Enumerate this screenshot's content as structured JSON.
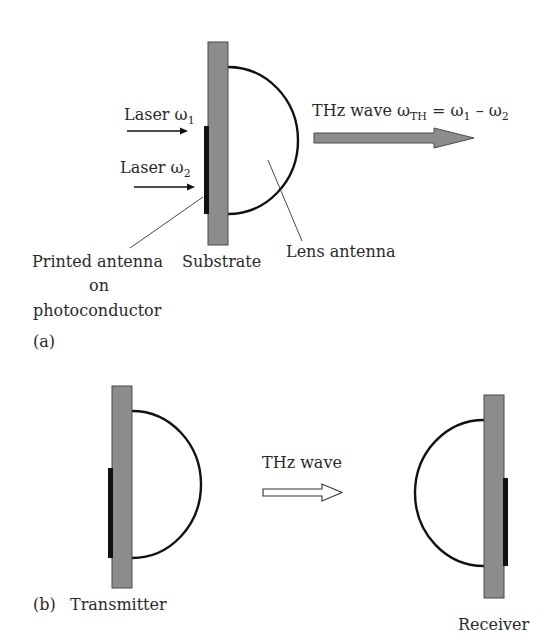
{
  "panel_a": {
    "tag": "(a)",
    "laser1": {
      "label": "Laser ω",
      "sub": "1"
    },
    "laser2": {
      "label": "Laser ω",
      "sub": "2"
    },
    "thz_label": {
      "prefix": "THz wave ω",
      "sub_th": "TH",
      "eq": " = ω",
      "sub1": "1",
      "minus": " – ω",
      "sub2": "2"
    },
    "printed_antenna_label": [
      "Printed antenna",
      "on",
      "photoconductor"
    ],
    "substrate_label": "Substrate",
    "lens_label": "Lens antenna"
  },
  "panel_b": {
    "tag": "(b)",
    "transmitter_label": "Transmitter",
    "receiver_label": "Receiver",
    "thz_label": "THz wave"
  },
  "colors": {
    "substrate_fill": "#8c8c8c",
    "substrate_stroke": "#4a4a4a",
    "antenna": "#111111",
    "lens_stroke": "#111111",
    "arrow_fill": "#8c8c8c",
    "text": "#2a2a2a"
  }
}
